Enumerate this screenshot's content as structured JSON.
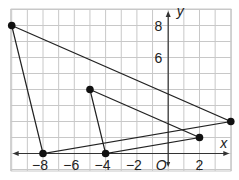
{
  "chart_data": {
    "type": "scatter",
    "title": "",
    "xlabel": "x",
    "ylabel": "y",
    "origin_label": "O",
    "xlim": [
      -10,
      4
    ],
    "ylim": [
      -1,
      9
    ],
    "grid": true,
    "x_ticks": [
      -8,
      -6,
      -4,
      -2,
      2
    ],
    "x_tick_labels": [
      "−8",
      "−6",
      "−4",
      "−2",
      "2"
    ],
    "y_ticks": [
      6,
      8
    ],
    "y_tick_labels": [
      "6",
      "8"
    ],
    "series": [
      {
        "name": "large triangle",
        "shape": "polygon",
        "points": [
          [
            -10,
            8
          ],
          [
            -8,
            0
          ],
          [
            4,
            2
          ]
        ]
      },
      {
        "name": "small triangle",
        "shape": "polygon",
        "points": [
          [
            -5,
            4
          ],
          [
            -4,
            0
          ],
          [
            2,
            1
          ]
        ]
      }
    ]
  }
}
